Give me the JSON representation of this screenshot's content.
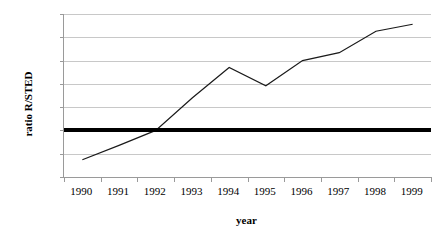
{
  "chart_data": {
    "type": "line",
    "title": "",
    "subtitle": "",
    "xlabel": "year",
    "ylabel": "ratio R/STED",
    "categories": [
      "1990",
      "1991",
      "1992",
      "1993",
      "1994",
      "1995",
      "1996",
      "1997",
      "1998",
      "1999"
    ],
    "series": [
      {
        "name": "ratio R/STED",
        "values": [
          37,
          68,
          100,
          170,
          235,
          196,
          250,
          267,
          313,
          328
        ],
        "color": "#1a1a1a",
        "line_width": 1.2,
        "markers": "none"
      }
    ],
    "reference_lines": [
      {
        "name": "reference-100",
        "orientation": "horizontal",
        "value": 100,
        "color": "#000000",
        "thickness": 4
      }
    ],
    "ylim": [
      0,
      350
    ],
    "y_ticks": [
      0,
      50,
      100,
      150,
      200,
      250,
      300,
      350
    ],
    "y_tick_labels": [
      "0",
      "50",
      "100",
      "150",
      "200",
      "250",
      "300",
      "350"
    ],
    "x_tick_labels": [
      "1990",
      "1991",
      "1992",
      "1993",
      "1994",
      "1995",
      "1996",
      "1997",
      "1998",
      "1999"
    ],
    "grid": {
      "horizontal": true,
      "vertical": false,
      "color": "#c8c8c8"
    },
    "legend": {
      "visible": false,
      "position": "none"
    },
    "plot_background": "#ffffff",
    "axis_color": "#9a9a9a"
  }
}
